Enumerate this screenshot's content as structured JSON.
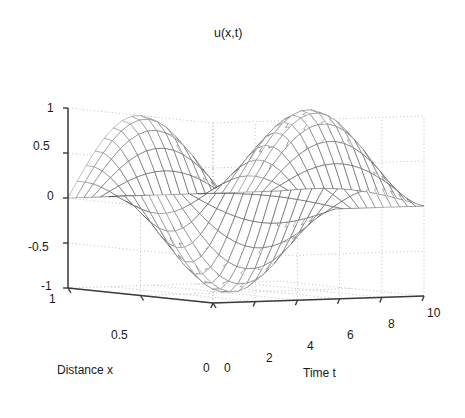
{
  "chart_data": {
    "type": "line",
    "render": "3d-mesh-surface",
    "title": "u(x,t)",
    "xlabel": "Distance x",
    "ylabel": "Time t",
    "zlabel": "u(x,t)",
    "grid": true,
    "legend": "none",
    "x": {
      "name": "Distance x",
      "lim": [
        0,
        1
      ],
      "ticks": [
        0,
        0.5,
        1
      ],
      "ticklabels": [
        "0",
        "0.5",
        "1"
      ],
      "direction": "decreasing-left-to-right"
    },
    "y": {
      "name": "Time t",
      "lim": [
        0,
        10
      ],
      "ticks": [
        0,
        2,
        4,
        6,
        8,
        10
      ],
      "ticklabels": [
        "0",
        "2",
        "4",
        "6",
        "8",
        "10"
      ]
    },
    "z": {
      "name": "u(x,t)",
      "lim": [
        -1,
        1
      ],
      "ticks": [
        -1,
        -0.5,
        0,
        0.5,
        1
      ],
      "ticklabels": [
        "-1",
        "-0.5",
        "0",
        "0.5",
        "1"
      ]
    },
    "surface": {
      "function": "u(x,t) = sin(pi*x) * cos(2*pi*t/8.1)",
      "nx": 16,
      "nt": 26,
      "description": "Standing wave: half sine in x, cosine oscillation in t; crest near t=0-2, trough near t=4-5, second crest near t=8-10",
      "amplitude": 1.0,
      "period_t": 8.1
    },
    "colors": {
      "mesh": "#8a8a8a",
      "mesh_dark": "#4a4a4a",
      "axis": "#3a3a3a",
      "grid": "#b8b8b8",
      "text": "#1a1a1a",
      "background": "#ffffff"
    },
    "view": {
      "azimuth": -37.5,
      "elevation": 30
    }
  },
  "axes": {
    "title": "u(x,t)",
    "x_label": "Distance x",
    "y_label": "Time t",
    "z_ticks": [
      "1",
      "0.5",
      "0",
      "-0.5",
      "-1"
    ],
    "x_ticks": [
      "1",
      "0.5",
      "0"
    ],
    "y_ticks": [
      "0",
      "2",
      "4",
      "6",
      "8",
      "10"
    ]
  }
}
